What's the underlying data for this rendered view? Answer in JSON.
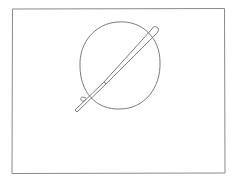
{
  "sketch": {
    "description": "Pencil sketch of a circle pierced diagonally by a pen inside a rectangular frame",
    "stroke_color": "#6b6b6b",
    "frame_color": "#8a8a8a",
    "background": "#ffffff",
    "frame": {
      "x": 12,
      "y": 8,
      "width": 213,
      "height": 165
    },
    "circle": {
      "cx": 120,
      "cy": 65,
      "rx": 40,
      "ry": 44
    },
    "pen": {
      "x1": 75,
      "y1": 111,
      "x2": 156,
      "y2": 29
    }
  }
}
